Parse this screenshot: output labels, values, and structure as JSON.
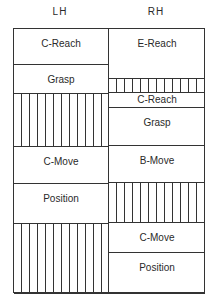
{
  "columns": {
    "left": "LH",
    "right": "RH"
  },
  "lh": [
    {
      "label": "C-Reach",
      "top": 0,
      "height": 36,
      "hatched": false
    },
    {
      "label": "Grasp",
      "top": 36,
      "height": 29,
      "hatched": false
    },
    {
      "label": "",
      "top": 65,
      "height": 53,
      "hatched": true
    },
    {
      "label": "C-Move",
      "top": 118,
      "height": 37,
      "hatched": false
    },
    {
      "label": "Position",
      "top": 155,
      "height": 40,
      "hatched": false
    },
    {
      "label": "",
      "top": 195,
      "height": 70,
      "hatched": true
    }
  ],
  "rh": [
    {
      "label": "E-Reach",
      "top": 0,
      "height": 50,
      "hatched": false
    },
    {
      "label": "",
      "top": 50,
      "height": 14,
      "hatched": true
    },
    {
      "label": "C-Reach",
      "top": 64,
      "height": 15,
      "hatched": false
    },
    {
      "label": "Grasp",
      "top": 79,
      "height": 38,
      "hatched": false
    },
    {
      "label": "B-Move",
      "top": 117,
      "height": 37,
      "hatched": false
    },
    {
      "label": "",
      "top": 154,
      "height": 40,
      "hatched": true
    },
    {
      "label": "C-Move",
      "top": 194,
      "height": 30,
      "hatched": false
    },
    {
      "label": "Position",
      "top": 224,
      "height": 41,
      "hatched": false
    }
  ]
}
